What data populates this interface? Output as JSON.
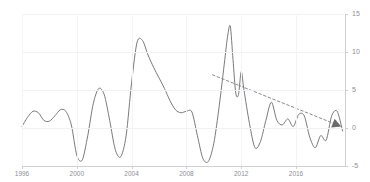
{
  "title": {
    "text": "",
    "note": "cut-off-at-top-edge"
  },
  "axes": {
    "x": {
      "ticks": [
        "1996",
        "2000",
        "2004",
        "2008",
        "2012",
        "2016"
      ],
      "tick_values": [
        1996,
        2000,
        2004,
        2008,
        2012,
        2016
      ],
      "range": [
        1996,
        2019.5
      ]
    },
    "y": {
      "ticks": [
        "15",
        "10",
        "5",
        "0",
        "-5"
      ],
      "tick_values": [
        15,
        10,
        5,
        0,
        -5
      ],
      "range": [
        -5,
        15
      ],
      "position": "right"
    }
  },
  "colors": {
    "line": "#6b6b6b",
    "trend": "#8a8a92",
    "grid": "#f1f1f4",
    "axis": "#cfcfd4",
    "tick_text": "#8e8e96",
    "background": "#ffffff"
  },
  "chart_data": {
    "type": "line",
    "title": "",
    "xlabel": "",
    "ylabel": "",
    "xlim": [
      1996,
      2019.5
    ],
    "ylim": [
      -5,
      15
    ],
    "grid": true,
    "legend": "none",
    "series": [
      {
        "name": "main",
        "style": "solid",
        "x": [
          1996.0,
          1996.4,
          1996.8,
          1997.2,
          1997.6,
          1998.0,
          1998.4,
          1998.8,
          1999.2,
          1999.6,
          2000.0,
          2000.4,
          2000.8,
          2001.2,
          2001.6,
          2002.0,
          2002.4,
          2002.8,
          2003.2,
          2003.6,
          2004.0,
          2004.4,
          2004.8,
          2005.2,
          2005.6,
          2006.0,
          2006.4,
          2006.8,
          2007.2,
          2007.6,
          2008.0,
          2008.4,
          2008.8,
          2009.2,
          2009.6,
          2010.0,
          2010.4,
          2010.8,
          2011.0,
          2011.2,
          2011.4,
          2011.6,
          2011.8,
          2012.0,
          2012.2,
          2012.6,
          2013.0,
          2013.4,
          2013.8,
          2014.2,
          2014.6,
          2015.0,
          2015.4,
          2015.8,
          2016.2,
          2016.6,
          2017.0,
          2017.4,
          2017.8,
          2018.2,
          2018.6,
          2019.0,
          2019.4
        ],
        "y": [
          0.2,
          1.4,
          2.2,
          2.0,
          1.0,
          0.9,
          1.6,
          2.4,
          2.2,
          0.4,
          -3.6,
          -4.2,
          -1.0,
          3.2,
          5.2,
          4.4,
          1.0,
          -2.8,
          -3.8,
          -1.0,
          6.0,
          11.3,
          11.5,
          9.6,
          8.0,
          6.6,
          5.2,
          3.6,
          2.4,
          2.0,
          2.2,
          2.1,
          -1.0,
          -4.0,
          -4.4,
          -2.0,
          3.0,
          9.0,
          12.0,
          13.4,
          9.0,
          4.6,
          4.4,
          7.4,
          5.0,
          0.6,
          -2.6,
          -1.8,
          1.0,
          3.4,
          1.0,
          0.4,
          1.2,
          0.2,
          1.8,
          1.6,
          -1.2,
          -2.6,
          -1.0,
          -1.6,
          1.6,
          2.2,
          -0.4
        ]
      },
      {
        "name": "trend",
        "style": "dashed",
        "arrow_end": true,
        "x": [
          2009.9,
          2019.3
        ],
        "y": [
          7.0,
          0.2
        ]
      }
    ]
  }
}
